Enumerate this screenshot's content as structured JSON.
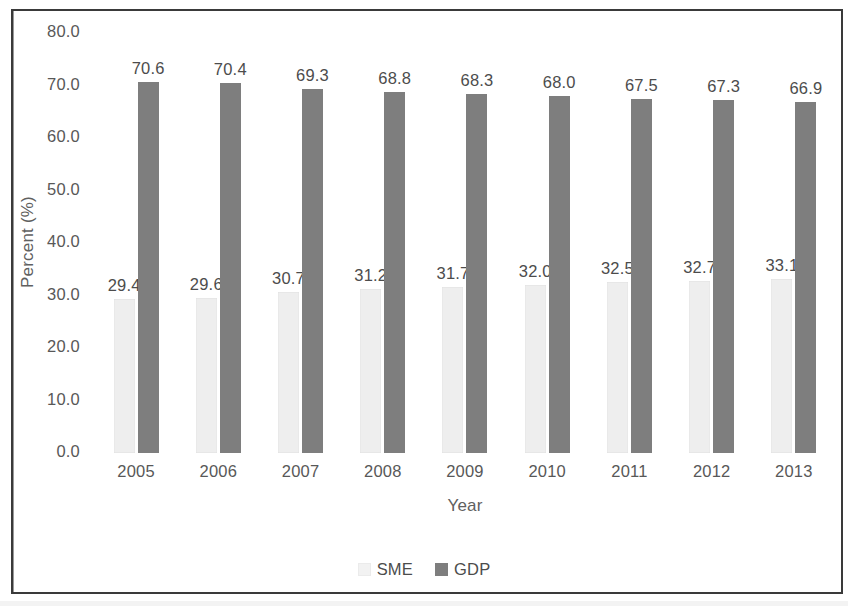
{
  "chart_data": {
    "type": "bar",
    "title": "",
    "xlabel": "Year",
    "ylabel": "Percent (%)",
    "categories": [
      "2005",
      "2006",
      "2007",
      "2008",
      "2009",
      "2010",
      "2011",
      "2012",
      "2013"
    ],
    "series": [
      {
        "name": "SME",
        "color": "#eeeeee",
        "values": [
          29.4,
          29.6,
          30.7,
          31.2,
          31.7,
          32.0,
          32.5,
          32.7,
          33.1
        ],
        "labels": [
          "29.4",
          "29.6",
          "30.7",
          "31.2",
          "31.7",
          "32.0",
          "32.5",
          "32.7",
          "33.1"
        ]
      },
      {
        "name": "GDP",
        "color": "#7e7e7e",
        "values": [
          70.6,
          70.4,
          69.3,
          68.8,
          68.3,
          68.0,
          67.5,
          67.3,
          66.9
        ],
        "labels": [
          "70.6",
          "70.4",
          "69.3",
          "68.8",
          "68.3",
          "68.0",
          "67.5",
          "67.3",
          "66.9"
        ]
      }
    ],
    "ylim": [
      0,
      80
    ],
    "ytick_labels": [
      "80.0",
      "70.0",
      "60.0",
      "50.0",
      "40.0",
      "30.0",
      "20.0",
      "10.0",
      "0.0"
    ],
    "ytick_values": [
      80,
      70,
      60,
      50,
      40,
      30,
      20,
      10,
      0
    ],
    "grid": false,
    "legend_position": "bottom",
    "legend_entries": [
      "SME",
      "GDP"
    ]
  }
}
